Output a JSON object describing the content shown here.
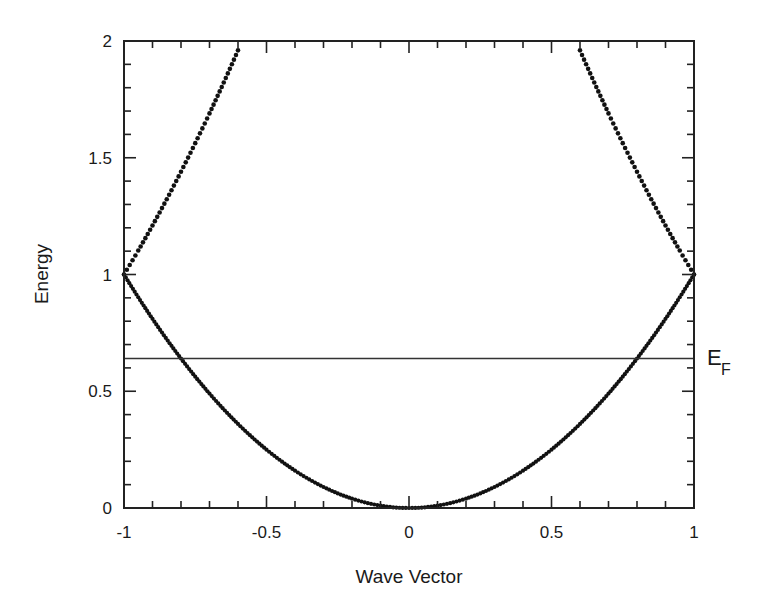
{
  "chart_data": {
    "type": "scatter",
    "title": "",
    "xlabel": "Wave Vector",
    "ylabel": "Energy",
    "xlim": [
      -1,
      1
    ],
    "ylim": [
      0,
      2
    ],
    "grid": false,
    "legend": null,
    "x_ticks": [
      -1,
      -0.5,
      0,
      0.5,
      1
    ],
    "x_tick_labels": [
      "-1",
      "-0.5",
      "0",
      "0.5",
      "1"
    ],
    "y_ticks": [
      0,
      0.5,
      1,
      1.5,
      2
    ],
    "y_tick_labels": [
      "0",
      "0.5",
      "1",
      "1.5",
      "2"
    ],
    "minor_tick_step": 0.1,
    "series": [
      {
        "name": "Lower band (E = k^2)",
        "style": "dotted",
        "x": [
          -1.0,
          -0.9,
          -0.8,
          -0.7,
          -0.6,
          -0.5,
          -0.4,
          -0.3,
          -0.2,
          -0.1,
          0.0,
          0.1,
          0.2,
          0.3,
          0.4,
          0.5,
          0.6,
          0.7,
          0.8,
          0.9,
          1.0
        ],
        "y": [
          1.0,
          0.81,
          0.64,
          0.49,
          0.36,
          0.25,
          0.16,
          0.09,
          0.04,
          0.01,
          0.0,
          0.01,
          0.04,
          0.09,
          0.16,
          0.25,
          0.36,
          0.49,
          0.64,
          0.81,
          1.0
        ]
      },
      {
        "name": "Upper band left (E = (2+k)^2)",
        "style": "dotted",
        "x": [
          -1.0,
          -0.95,
          -0.9,
          -0.85,
          -0.8,
          -0.75,
          -0.7,
          -0.65,
          -0.6
        ],
        "y": [
          1.0,
          1.1025,
          1.21,
          1.3225,
          1.44,
          1.5625,
          1.69,
          1.8225,
          1.96
        ]
      },
      {
        "name": "Upper band right (E = (2-k)^2)",
        "style": "dotted",
        "x": [
          0.6,
          0.65,
          0.7,
          0.75,
          0.8,
          0.85,
          0.9,
          0.95,
          1.0
        ],
        "y": [
          1.96,
          1.8225,
          1.69,
          1.5625,
          1.44,
          1.3225,
          1.21,
          1.1025,
          1.0
        ]
      }
    ],
    "annotations": [
      {
        "type": "hline",
        "y": 0.64,
        "label": "E",
        "subscript": "F",
        "position": "right"
      }
    ]
  },
  "labels": {
    "xlabel": "Wave Vector",
    "ylabel": "Energy",
    "fermi_main": "E",
    "fermi_sub": "F"
  }
}
